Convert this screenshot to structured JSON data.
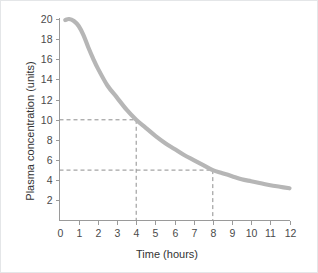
{
  "figure": {
    "background_color": "#ffffff",
    "border_color": "#e4e6e8"
  },
  "chart_data": {
    "type": "line",
    "title": "",
    "subtitle": "",
    "xlabel": "Time (hours)",
    "ylabel": "Plasma concentration (units)",
    "xlim": [
      0,
      12
    ],
    "ylim": [
      0,
      20
    ],
    "xticks": [
      0,
      1,
      2,
      3,
      4,
      5,
      6,
      7,
      8,
      9,
      10,
      11,
      12
    ],
    "xtick_labels": [
      "0",
      "1",
      "2",
      "3",
      "4",
      "5",
      "6",
      "7",
      "8",
      "9",
      "10",
      "11",
      "12"
    ],
    "yticks": [
      2,
      4,
      6,
      8,
      10,
      12,
      14,
      16,
      18,
      20
    ],
    "ytick_labels": [
      "2",
      "4",
      "6",
      "8",
      "10",
      "12",
      "14",
      "16",
      "18",
      "20"
    ],
    "grid": false,
    "legend": null,
    "series": [
      {
        "name": "Plasma concentration",
        "color": "#b6b6b6",
        "line_width": 4.2,
        "x": [
          0.3,
          0.5,
          0.75,
          1.0,
          1.25,
          1.5,
          1.75,
          2.0,
          2.5,
          3.0,
          3.5,
          4.0,
          4.5,
          5.0,
          5.5,
          6.0,
          6.5,
          7.0,
          7.5,
          8.0,
          8.5,
          9.0,
          9.5,
          10.0,
          10.5,
          11.0,
          11.5,
          12.0
        ],
        "y": [
          19.9,
          20.0,
          19.8,
          19.3,
          18.4,
          17.2,
          16.1,
          15.1,
          13.4,
          12.2,
          11.0,
          10.0,
          9.2,
          8.4,
          7.7,
          7.1,
          6.5,
          6.0,
          5.5,
          5.0,
          4.7,
          4.4,
          4.1,
          3.9,
          3.7,
          3.5,
          3.35,
          3.2
        ]
      }
    ],
    "annotations": [
      {
        "name": "half-life-marker-1",
        "style": "dashed-guide",
        "x": 4,
        "y": 10,
        "color": "#8e8e8e",
        "description": "Dashed guide lines from y-axis at 10 units to the curve at 4 hours, then down to the x-axis."
      },
      {
        "name": "half-life-marker-2",
        "style": "dashed-guide",
        "x": 8,
        "y": 5,
        "color": "#8e8e8e",
        "description": "Dashed guide lines from y-axis at 5 units to the curve at 8 hours, then down to the x-axis."
      }
    ]
  }
}
